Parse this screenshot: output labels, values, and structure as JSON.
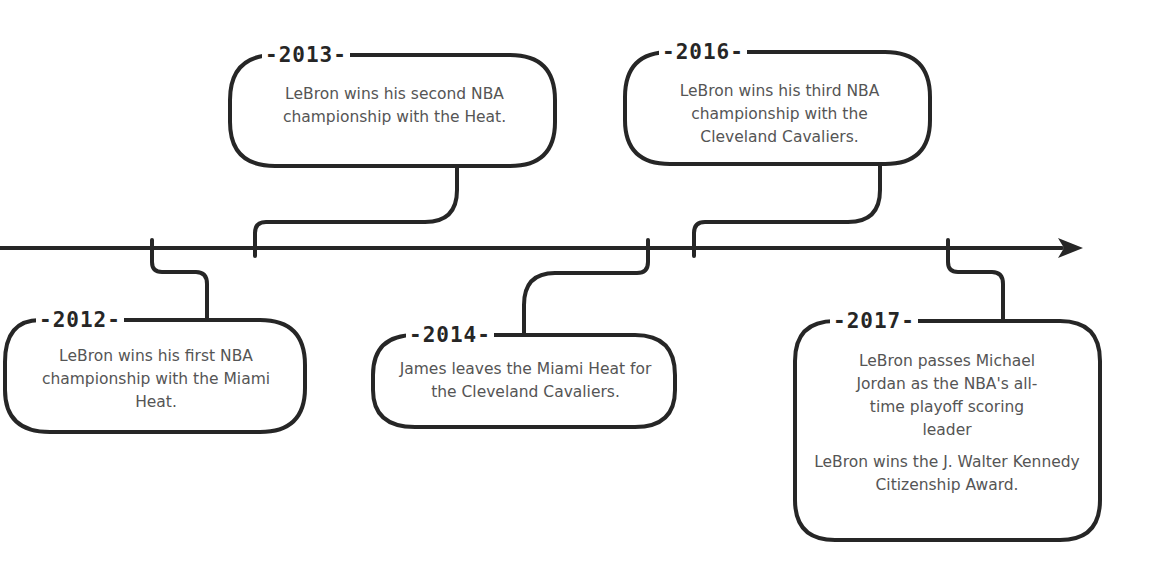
{
  "diagram": {
    "type": "timeline",
    "colors": {
      "line": "#262626",
      "text": "#555555",
      "year_label": "#262626",
      "background": "#ffffff"
    },
    "events": [
      {
        "year_label": "-2012-",
        "year": "2012",
        "position": "below",
        "descriptions": [
          "LeBron wins his first NBA championship with the Miami Heat."
        ]
      },
      {
        "year_label": "-2013-",
        "year": "2013",
        "position": "above",
        "descriptions": [
          "LeBron wins his second NBA championship with the Heat."
        ]
      },
      {
        "year_label": "-2014-",
        "year": "2014",
        "position": "below",
        "descriptions": [
          "James leaves the Miami Heat for the Cleveland Cavaliers."
        ]
      },
      {
        "year_label": "-2016-",
        "year": "2016",
        "position": "above",
        "descriptions": [
          "LeBron wins his third NBA championship with the Cleveland Cavaliers."
        ]
      },
      {
        "year_label": "-2017-",
        "year": "2017",
        "position": "below",
        "descriptions": [
          "LeBron passes Michael Jordan as the NBA's all-time playoff scoring leader",
          "LeBron wins the J. Walter Kennedy Citizenship Award."
        ]
      }
    ]
  }
}
